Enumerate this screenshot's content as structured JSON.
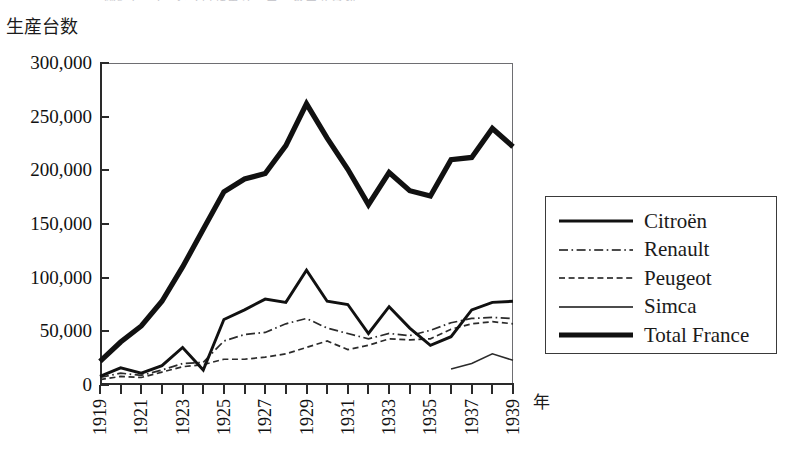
{
  "header": {
    "cropped_text": "図3-4　フランス自動車メーカーの生産台数"
  },
  "axis": {
    "y_caption": "生産台数",
    "x_caption": "年"
  },
  "chart_data": {
    "type": "line",
    "title": "",
    "xlabel": "年",
    "ylabel": "生産台数",
    "xlim": [
      1919,
      1939
    ],
    "ylim": [
      0,
      300000
    ],
    "yticks": [
      0,
      50000,
      100000,
      150000,
      200000,
      250000,
      300000
    ],
    "ytick_labels": [
      "0",
      "50,000",
      "100,000",
      "150,000",
      "200,000",
      "250,000",
      "300,000"
    ],
    "x": [
      1919,
      1920,
      1921,
      1922,
      1923,
      1924,
      1925,
      1926,
      1927,
      1928,
      1929,
      1930,
      1931,
      1932,
      1933,
      1934,
      1935,
      1936,
      1937,
      1938,
      1939
    ],
    "xtick_labels": [
      "1919",
      "1921",
      "1923",
      "1925",
      "1927",
      "1929",
      "1931",
      "1933",
      "1935",
      "1937",
      "1939"
    ],
    "xtick_every": 2,
    "grid": false,
    "legend_position": "right",
    "series": [
      {
        "name": "Citroën",
        "style": "solid-medium",
        "values": [
          8000,
          16000,
          11000,
          18000,
          35000,
          14000,
          61000,
          70000,
          80000,
          77000,
          107000,
          78000,
          75000,
          48000,
          73000,
          53000,
          37000,
          45000,
          70000,
          77000,
          78000
        ]
      },
      {
        "name": "Renault",
        "style": "dash-dot",
        "values": [
          7000,
          11000,
          9000,
          14000,
          20000,
          21000,
          41000,
          47000,
          49000,
          57000,
          62000,
          53000,
          48000,
          43000,
          48000,
          46000,
          51000,
          58000,
          62000,
          63000,
          62000
        ]
      },
      {
        "name": "Peugeot",
        "style": "dashed",
        "values": [
          5000,
          8000,
          7000,
          12000,
          17000,
          19000,
          24000,
          24000,
          26000,
          29000,
          35000,
          41000,
          33000,
          37000,
          43000,
          42000,
          43000,
          52000,
          57000,
          59000,
          57000
        ]
      },
      {
        "name": "Simca",
        "style": "solid-thin",
        "values": [
          null,
          null,
          null,
          null,
          null,
          null,
          null,
          null,
          null,
          null,
          null,
          null,
          null,
          null,
          null,
          null,
          null,
          15000,
          20000,
          29000,
          23000
        ]
      },
      {
        "name": "Total France",
        "style": "solid-thick",
        "values": [
          22000,
          40000,
          55000,
          78000,
          110000,
          145000,
          180000,
          192000,
          197000,
          223000,
          262000,
          230000,
          201000,
          168000,
          198000,
          181000,
          176000,
          210000,
          212000,
          239000,
          222000
        ]
      }
    ]
  },
  "legend": {
    "items": [
      {
        "label": "Citroën",
        "style": "solid-medium"
      },
      {
        "label": "Renault",
        "style": "dash-dot"
      },
      {
        "label": "Peugeot",
        "style": "dashed"
      },
      {
        "label": "Simca",
        "style": "solid-thin"
      },
      {
        "label": "Total France",
        "style": "solid-thick"
      }
    ]
  },
  "colors": {
    "ink": "#111111",
    "frame": "#6e6e72",
    "background": "#ffffff"
  }
}
